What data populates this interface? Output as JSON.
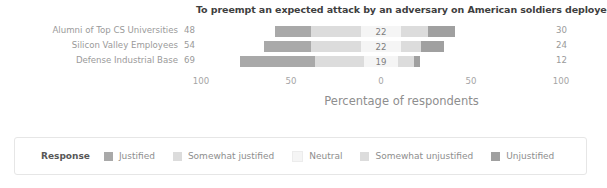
{
  "chart_data": {
    "type": "bar",
    "subtype": "diverging-stacked-likert",
    "title": "To preempt an expected attack by an adversary on American soldiers deployed abroad",
    "xlabel": "Percentage of respondents",
    "ylabel": "",
    "xlim": [
      -100,
      100
    ],
    "xticks": [
      -100,
      -50,
      0,
      50,
      100
    ],
    "xtick_labels": [
      "100",
      "50",
      "0",
      "50",
      "100"
    ],
    "grid": false,
    "legend_position": "bottom",
    "legend_title": "Response",
    "categories": [
      "Alumni of Top CS Universities",
      "Silicon Valley Employees",
      "Defense Industrial Base"
    ],
    "series": [
      {
        "name": "Justified",
        "color": "#a9a9a9",
        "values": [
          20,
          26,
          42
        ]
      },
      {
        "name": "Somewhat justified",
        "color": "#dcdcdc",
        "values": [
          28,
          28,
          27
        ]
      },
      {
        "name": "Neutral",
        "color": "#f5f5f5",
        "values": [
          22,
          22,
          19
        ]
      },
      {
        "name": "Somewhat unjustified",
        "color": "#dcdcdc",
        "values": [
          15,
          11,
          9
        ]
      },
      {
        "name": "Unjustified",
        "color": "#a0a0a0",
        "values": [
          15,
          13,
          3
        ]
      }
    ],
    "annotations": {
      "left_totals": [
        48,
        54,
        69
      ],
      "center_values": [
        22,
        22,
        19
      ],
      "right_totals": [
        30,
        24,
        12
      ]
    }
  },
  "chart": {
    "title": "To preempt an expected attack by an adversary on American soldiers deployed abroad",
    "x_axis_title": "Percentage of respondents",
    "tick_labels": [
      "100",
      "50",
      "0",
      "50",
      "100"
    ],
    "rows": [
      {
        "label": "Alumni of Top CS Universities",
        "left_total": "48",
        "center_value": "22",
        "right_total": "30"
      },
      {
        "label": "Silicon Valley Employees",
        "left_total": "54",
        "center_value": "22",
        "right_total": "24"
      },
      {
        "label": "Defense Industrial Base",
        "left_total": "69",
        "center_value": "19",
        "right_total": "12"
      }
    ]
  },
  "legend": {
    "title": "Response",
    "items": [
      {
        "label": "Justified",
        "color": "#a9a9a9"
      },
      {
        "label": "Somewhat justified",
        "color": "#dcdcdc"
      },
      {
        "label": "Neutral",
        "color": "#f5f5f5"
      },
      {
        "label": "Somewhat unjustified",
        "color": "#dcdcdc"
      },
      {
        "label": "Unjustified",
        "color": "#a0a0a0"
      }
    ]
  }
}
